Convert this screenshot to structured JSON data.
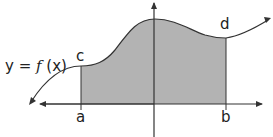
{
  "figure": {
    "function_label_prefix": "y = ",
    "function_name": "f",
    "function_arg": " (x)",
    "points": {
      "a": "a",
      "b": "b",
      "c": "c",
      "d": "d"
    },
    "colors": {
      "shade": "#b3b3b3",
      "line": "#333333",
      "background": "#ffffff"
    }
  }
}
